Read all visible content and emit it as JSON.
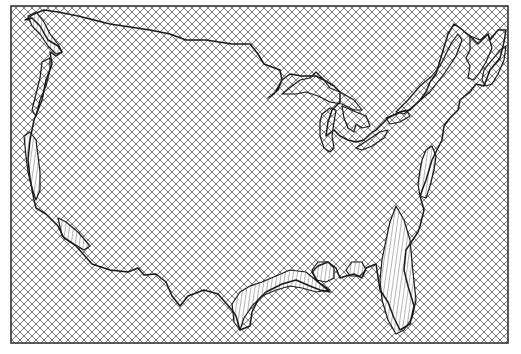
{
  "map": {
    "width": 521,
    "height": 354,
    "frame": {
      "x": 11,
      "y": 6,
      "width": 497,
      "height": 337
    },
    "colors": {
      "background": "#ffffff",
      "hatch": "#6a6a6a",
      "outline": "#1a1a1a",
      "frame": "#333333",
      "stripe": "#444444"
    },
    "hatch_spacing": 8,
    "regions": [
      {
        "name": "contiguous-us-outline",
        "path": "M25,20 L32,18 L40,26 L48,40 L58,46 L62,52 L56,56 L50,52 L52,64 L46,80 L42,100 L34,120 L30,140 L28,160 L30,178 L34,200 L36,208 L46,214 L58,226 L64,238 L76,246 L92,264 L110,270 L128,272 L138,268 L144,275 L156,274 L166,282 L172,296 L180,306 L188,296 L204,290 L218,294 L232,310 L236,316 L240,330 L250,326 L252,312 L258,300 L266,292 L282,284 L296,280 L310,286 L320,290 L330,292 L318,282 L312,272 L318,266 L328,262 L336,268 L340,278 L346,276 L354,274 L362,278 L366,268 L376,264 L380,290 L388,302 L394,318 L400,330 L410,324 L414,306 L408,286 L404,270 L406,250 L414,238 L418,232 L420,226 L424,210 L420,196 L426,180 L432,160 L438,148 L442,140 L444,126 L450,118 L458,110 L460,100 L470,92 L476,84 L484,86 L490,70 L500,58 L504,42 L506,30 L498,30 L490,40 L488,34 L478,44 L470,36 L460,28 L454,24 L448,34 L442,54 L436,74 L430,82 L426,92 L420,100 L410,110 L400,112 L388,118 L382,124 L376,130 L370,134 L364,140 L356,142 L348,140 L340,136 L334,130 L326,136 L328,122 L332,110 L340,102 L340,92 L334,86 L324,80 L316,76 L302,76 L290,74 L282,80 L274,94 L268,98 L278,90 L282,80 L280,70 L264,64 L258,54 L250,44 L232,44 L206,40 L186,40 L170,34 L150,30 L110,24 L78,16 L58,12 L44,10 L34,14 Z"
      },
      {
        "name": "lake-superior",
        "path": "M282,94 L292,86 L300,80 L310,78 L316,72 L324,80 L330,88 L340,92 L354,100 L362,110 L354,110 L342,104 L330,102 L318,96 L306,92 L296,94 Z"
      },
      {
        "name": "lake-michigan",
        "path": "M322,114 L330,108 L336,110 L334,122 L332,136 L334,148 L330,152 L324,148 L320,136 L320,122 Z"
      },
      {
        "name": "lake-huron",
        "path": "M342,106 L356,112 L366,116 L370,126 L362,128 L356,124 L354,132 L348,128 L344,118 Z"
      },
      {
        "name": "lake-erie",
        "path": "M356,148 L368,140 L380,132 L388,130 L384,138 L372,146 L362,150 Z"
      },
      {
        "name": "lake-ontario",
        "path": "M386,118 L396,114 L406,110 L410,116 L400,122 L390,124 Z"
      },
      {
        "name": "st-lawrence",
        "path": "M396,112 L408,100 L420,86 L432,76 L440,66 L446,54 L452,42 L458,34 L462,40 L456,56 L444,74 L430,92 L416,104 L404,114 Z"
      },
      {
        "name": "maine-coast",
        "path": "M470,36 L480,40 L488,34 L492,48 L486,62 L480,72 L474,80 L468,78 L470,66 L466,58 L470,50 Z"
      },
      {
        "name": "nova-scotia",
        "path": "M484,70 L492,60 L500,50 L506,46 L504,60 L498,74 L492,84 L486,86 L482,80 Z"
      },
      {
        "name": "chesapeake-delmarva",
        "path": "M426,150 L432,146 L436,156 L434,170 L430,186 L426,198 L420,196 L418,184 L420,170 L422,160 Z"
      },
      {
        "name": "florida-peninsula",
        "path": "M396,206 L404,220 L410,240 L412,262 L414,282 L416,300 L412,318 L404,330 L396,334 L388,320 L382,300 L380,280 L382,260 L386,240 L390,222 Z"
      },
      {
        "name": "gulf-coast-texas",
        "path": "M232,304 L240,292 L250,286 L262,282 L276,276 L290,270 L306,272 L318,282 L330,290 L316,292 L302,288 L290,286 L276,290 L262,296 L252,306 L244,318 L240,330 L234,322 Z"
      },
      {
        "name": "mississippi-delta",
        "path": "M312,270 L318,262 L328,262 L334,268 L334,278 L326,282 L316,280 Z"
      },
      {
        "name": "mobile-bay",
        "path": "M346,270 L352,262 L362,262 L366,270 L360,276 L350,276 Z"
      },
      {
        "name": "puget-sound",
        "path": "M28,16 L36,12 L44,22 L50,34 L58,44 L62,52 L56,54 L48,46 L40,34 L32,26 Z"
      },
      {
        "name": "columbia-coast",
        "path": "M42,62 L50,58 L50,70 L46,86 L40,100 L36,116 L32,110 L36,94 L40,78 Z"
      },
      {
        "name": "california-coast",
        "path": "M24,136 L30,132 L36,140 L38,156 L40,172 L40,190 L36,200 L32,188 L28,172 L26,156 Z"
      },
      {
        "name": "socal-coast",
        "path": "M58,218 L66,222 L78,232 L90,246 L84,250 L74,244 L62,236 Z"
      }
    ],
    "striped_regions": [
      "florida-peninsula",
      "chesapeake-delmarva",
      "gulf-coast-texas",
      "mississippi-delta",
      "mobile-bay",
      "socal-coast",
      "california-coast",
      "puget-sound"
    ]
  }
}
